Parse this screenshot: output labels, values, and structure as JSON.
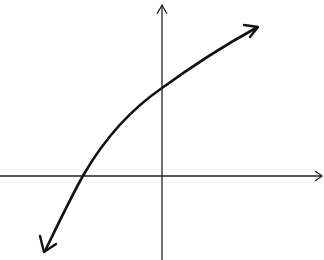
{
  "diagram": {
    "type": "function-graph",
    "description": "Increasing concave-down curve (logarithmic-like) on Cartesian axes",
    "axes": {
      "x_axis": {
        "y": 176,
        "x_start": 0,
        "x_end": 322,
        "arrow": "right"
      },
      "y_axis": {
        "x": 162,
        "y_start": 260,
        "y_end": 4,
        "arrow": "up"
      }
    },
    "curve": {
      "start": [
        44,
        252
      ],
      "x_intercept": [
        82,
        176
      ],
      "y_intercept": [
        162,
        88
      ],
      "end": [
        258,
        27
      ],
      "arrows": [
        "start",
        "end"
      ],
      "color": "#111111"
    },
    "colors": {
      "axis": "#222222",
      "curve": "#111111",
      "background": "#ffffff"
    }
  }
}
